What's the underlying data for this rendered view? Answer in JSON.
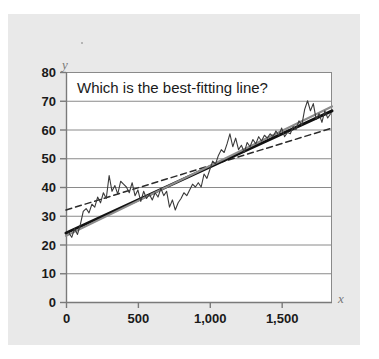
{
  "figure": {
    "title": "Which is the best-fitting line?",
    "background_color": "#ffffff",
    "panel_color": "#e9e9e9",
    "plot_background_color": "#ffffff",
    "gridline_color": "#808080",
    "axis_color": "#808080"
  },
  "chart_data": {
    "type": "line",
    "title": "Which is the best-fitting line?",
    "xlabel": "x",
    "ylabel": "y",
    "xlim": [
      0,
      1850
    ],
    "ylim": [
      0,
      80
    ],
    "grid": "horizontal",
    "legend": "none",
    "x_ticks": [
      0,
      500,
      1000,
      1500
    ],
    "x_tick_labels": [
      "0",
      "500",
      "1,000",
      "1,500"
    ],
    "y_ticks": [
      0,
      10,
      20,
      30,
      40,
      50,
      60,
      70,
      80
    ],
    "y_tick_labels": [
      "0",
      "10",
      "20",
      "30",
      "40",
      "50",
      "60",
      "70",
      "80"
    ],
    "series": [
      {
        "name": "noisy-data",
        "style": "jagged-line",
        "color": "#3a3a3a",
        "x": [
          20,
          40,
          60,
          80,
          100,
          120,
          140,
          160,
          180,
          200,
          220,
          240,
          260,
          280,
          300,
          320,
          340,
          360,
          380,
          400,
          420,
          440,
          460,
          480,
          500,
          520,
          540,
          560,
          580,
          600,
          620,
          640,
          660,
          680,
          700,
          720,
          740,
          760,
          780,
          800,
          820,
          840,
          860,
          880,
          900,
          920,
          940,
          960,
          980,
          1000,
          1020,
          1040,
          1060,
          1080,
          1100,
          1120,
          1140,
          1160,
          1180,
          1200,
          1220,
          1240,
          1260,
          1280,
          1300,
          1320,
          1340,
          1360,
          1380,
          1400,
          1420,
          1440,
          1460,
          1480,
          1500,
          1520,
          1540,
          1560,
          1580,
          1600,
          1620,
          1640,
          1660,
          1680,
          1700,
          1720,
          1740,
          1760,
          1780,
          1800,
          1820,
          1840
        ],
        "y": [
          24.0,
          22.5,
          25.5,
          23.5,
          27.0,
          31.5,
          32.5,
          31.0,
          34.0,
          33.0,
          36.5,
          34.5,
          38.0,
          36.0,
          44.0,
          38.5,
          40.5,
          37.5,
          42.0,
          41.0,
          40.0,
          38.0,
          41.5,
          37.0,
          39.0,
          35.0,
          38.5,
          36.0,
          37.5,
          35.5,
          38.0,
          36.5,
          39.5,
          37.0,
          38.5,
          33.0,
          35.5,
          32.0,
          34.5,
          36.0,
          38.0,
          37.0,
          39.0,
          41.0,
          40.0,
          41.5,
          40.0,
          44.5,
          43.0,
          46.0,
          49.0,
          48.0,
          51.0,
          53.0,
          52.0,
          55.0,
          58.5,
          54.0,
          57.0,
          53.0,
          54.5,
          52.0,
          55.5,
          54.0,
          56.5,
          55.0,
          57.5,
          56.0,
          58.0,
          57.0,
          58.5,
          57.5,
          59.5,
          58.0,
          60.5,
          57.5,
          59.0,
          58.5,
          61.0,
          60.0,
          63.0,
          61.5,
          67.0,
          70.0,
          66.5,
          69.0,
          63.5,
          65.5,
          62.5,
          66.5,
          64.0,
          65.5
        ]
      },
      {
        "name": "dashed-candidate-line",
        "style": "dashed",
        "color": "#2b2b2b",
        "intercept": 32.0,
        "slope_per_1000": 15.4,
        "endpoints": [
          [
            0,
            32.0
          ],
          [
            1850,
            60.5
          ]
        ]
      },
      {
        "name": "solid-black-candidate-line",
        "style": "solid-thick",
        "color": "#111111",
        "intercept": 24.0,
        "slope_per_1000": 23.0,
        "endpoints": [
          [
            0,
            24.0
          ],
          [
            1850,
            66.5
          ]
        ]
      },
      {
        "name": "gray-candidate-line",
        "style": "solid-gray",
        "color": "#8c8c8c",
        "intercept": 23.0,
        "slope_per_1000": 24.3,
        "endpoints": [
          [
            0,
            23.0
          ],
          [
            1850,
            68.0
          ]
        ]
      }
    ]
  }
}
